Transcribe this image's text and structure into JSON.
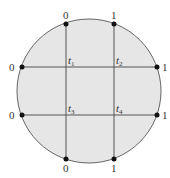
{
  "diagram": {
    "shape": "circle",
    "fill_color": "#e6e6e6",
    "stroke_color": "#666666",
    "line_color": "#555555",
    "top_labels": [
      "0",
      "1"
    ],
    "bottom_labels": [
      "0",
      "1"
    ],
    "left_labels": [
      "0",
      "0"
    ],
    "right_labels": [
      "1",
      "1"
    ],
    "intersections": [
      {
        "base": "t",
        "sub": "1"
      },
      {
        "base": "t",
        "sub": "2"
      },
      {
        "base": "t",
        "sub": "3"
      },
      {
        "base": "t",
        "sub": "4"
      }
    ]
  }
}
